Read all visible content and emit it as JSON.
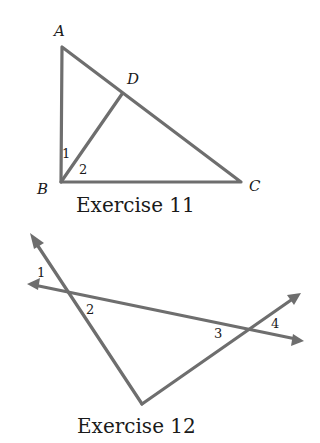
{
  "exercise11": {
    "caption": "Exercise 11",
    "points": {
      "A": "A",
      "B": "B",
      "C": "C",
      "D": "D"
    },
    "angles": {
      "a1": "1",
      "a2": "2"
    },
    "color": "#6e6e6e"
  },
  "exercise12": {
    "caption": "Exercise 12",
    "angles": {
      "a1": "1",
      "a2": "2",
      "a3": "3",
      "a4": "4"
    },
    "color": "#6e6e6e"
  }
}
